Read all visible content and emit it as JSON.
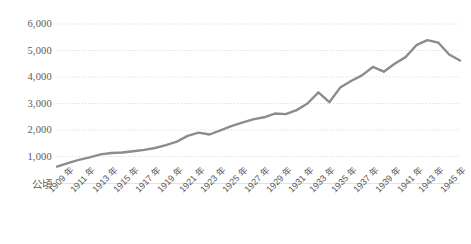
{
  "chart_data": {
    "type": "line",
    "title": "",
    "subtitle": "",
    "xlabel": "",
    "ylabel": "",
    "unit_label": "公頃",
    "grid": true,
    "legend": false,
    "legend_position": "none",
    "line_color": "#8c8c8c",
    "grid_color": "#d9d9d9",
    "axis_color": "#d9d9d9",
    "text_color": "#5a5a5a",
    "ylim": [
      0,
      6000
    ],
    "y_ticks": [
      1000,
      2000,
      3000,
      4000,
      5000,
      6000
    ],
    "y_tick_labels": [
      "1,000",
      "2,000",
      "3,000",
      "4,000",
      "5,000",
      "6,000"
    ],
    "x_tick_labels": [
      "1909 年",
      "1911 年",
      "1913 年",
      "1915 年",
      "1917 年",
      "1919 年",
      "1921 年",
      "1923 年",
      "1925 年",
      "1927 年",
      "1929 年",
      "1931 年",
      "1933 年",
      "1935 年",
      "1937 年",
      "1939 年",
      "1941 年",
      "1943 年",
      "1945 年"
    ],
    "x": [
      1909,
      1910,
      1911,
      1912,
      1913,
      1914,
      1915,
      1916,
      1917,
      1918,
      1919,
      1920,
      1921,
      1922,
      1923,
      1924,
      1925,
      1926,
      1927,
      1928,
      1929,
      1930,
      1931,
      1932,
      1933,
      1934,
      1935,
      1936,
      1937,
      1938,
      1939,
      1940,
      1941,
      1942,
      1943,
      1944,
      1945,
      1946
    ],
    "values": [
      620,
      750,
      870,
      970,
      1080,
      1130,
      1150,
      1200,
      1250,
      1320,
      1430,
      1560,
      1780,
      1900,
      1830,
      1990,
      2150,
      2280,
      2400,
      2480,
      2620,
      2600,
      2750,
      3000,
      3420,
      3050,
      3600,
      3850,
      4060,
      4380,
      4200,
      4500,
      4750,
      5200,
      5390,
      5300,
      4850,
      4620
    ],
    "series_name": "面積"
  }
}
